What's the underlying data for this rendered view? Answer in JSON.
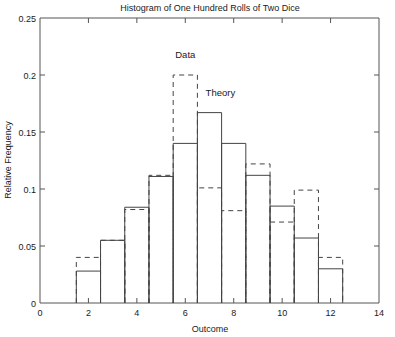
{
  "chart_data": {
    "type": "bar",
    "title": "Histogram of One Hundred Rolls of Two Dice",
    "xlabel": "Outcome",
    "ylabel": "Relative Frequency",
    "xlim": [
      0,
      14
    ],
    "ylim": [
      0,
      0.25
    ],
    "xticks": [
      0,
      2,
      4,
      6,
      8,
      10,
      12,
      14
    ],
    "xticklabels": [
      "0",
      "2",
      "4",
      "6",
      "8",
      "10",
      "12",
      "14"
    ],
    "yticks": [
      0,
      0.05,
      0.1,
      0.15,
      0.2,
      0.25
    ],
    "yticklabels": [
      "0",
      "0.05",
      "0.1",
      "0.15",
      "0.2",
      "0.25"
    ],
    "grid": false,
    "legend_position": "inline-annotations",
    "categories": [
      2,
      3,
      4,
      5,
      6,
      7,
      8,
      9,
      10,
      11,
      12
    ],
    "series": [
      {
        "name": "Data",
        "style": "dashed-outline",
        "values": [
          0.04,
          0.055,
          0.082,
          0.112,
          0.2,
          0.101,
          0.081,
          0.122,
          0.071,
          0.099,
          0.04
        ]
      },
      {
        "name": "Theory",
        "style": "solid-outline",
        "values": [
          0.028,
          0.055,
          0.084,
          0.111,
          0.14,
          0.167,
          0.14,
          0.112,
          0.085,
          0.057,
          0.03
        ]
      }
    ],
    "annotations": [
      {
        "text": "Data",
        "x": 6.0,
        "y": 0.215
      },
      {
        "text": "Theory",
        "x": 7.45,
        "y": 0.182
      }
    ]
  },
  "figure": {
    "background_color": "#ffffff",
    "axis_color": "#555555",
    "data_color": "#444444"
  }
}
